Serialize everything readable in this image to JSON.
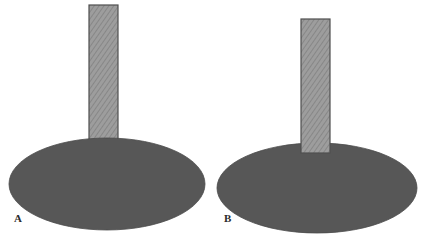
{
  "figure": {
    "canvas": {
      "width": 425,
      "height": 238,
      "background": "#ffffff"
    },
    "colors": {
      "ellipse_fill": "#575757",
      "ellipse_stroke": "#4a4a4a",
      "bar_fill": "#9d9d9d",
      "bar_hatch_line": "#828282",
      "bar_stroke": "#4f4f4f",
      "label_color": "#2b2b2b"
    },
    "panels": [
      {
        "id": "A",
        "label": "A",
        "label_position": {
          "x": 14,
          "y": 213
        },
        "description": "Vertical hatched bar occluded by (passing behind) the gray ellipse",
        "bar": {
          "name": "hatched-bar",
          "x": 89,
          "y": 5,
          "width": 29,
          "height": 140,
          "visible_bottom": 140,
          "depth_order": "behind-ellipse",
          "fill_pattern": "diagonal-hatch"
        },
        "ellipse": {
          "name": "gray-ellipse",
          "cx": 107,
          "cy": 184,
          "rx": 98,
          "ry": 46,
          "depth_order": "front"
        }
      },
      {
        "id": "B",
        "label": "B",
        "label_position": {
          "x": 224,
          "y": 213
        },
        "description": "Vertical hatched bar drawn in front of (overlapping) the gray ellipse",
        "bar": {
          "name": "hatched-bar",
          "x": 301,
          "y": 19,
          "width": 29,
          "height": 134,
          "visible_bottom": 153,
          "depth_order": "in-front-of-ellipse",
          "fill_pattern": "diagonal-hatch"
        },
        "ellipse": {
          "name": "gray-ellipse",
          "cx": 317,
          "cy": 188,
          "rx": 100,
          "ry": 45,
          "depth_order": "back"
        }
      }
    ]
  }
}
